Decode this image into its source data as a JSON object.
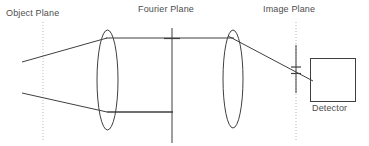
{
  "figure": {
    "width": 369,
    "height": 146,
    "background_color": "#ffffff",
    "ink_color": "#3f3f3f",
    "dotted_color": "#b4b4b4",
    "text_color": "#4d4d4d"
  },
  "labels": {
    "object_plane": "Object Plane",
    "fourier_plane": "Fourier Plane",
    "image_plane": "Image Plane",
    "detector": "Detector"
  },
  "elements": {
    "object_plane_line": {
      "name": "object-plane-dotted-line",
      "x": 43,
      "y_top": 22,
      "y_bottom": 141,
      "style": "dotted"
    },
    "fourier_plane_line": {
      "name": "fourier-plane-line",
      "x": 172,
      "y_top": 28,
      "y_bottom": 143,
      "style": "solid"
    },
    "image_plane_line": {
      "name": "image-plane-dotted-line",
      "x": 296,
      "y_top": 22,
      "y_bottom": 141,
      "style": "dotted"
    },
    "lens_1": {
      "name": "lens-one",
      "cx": 107.5,
      "cy": 80,
      "rx": 10.5,
      "ry": 50
    },
    "lens_2": {
      "name": "lens-two",
      "cx": 233,
      "cy": 79,
      "rx": 10,
      "ry": 49
    },
    "detector_box": {
      "name": "detector-box",
      "x": 310,
      "y": 58,
      "width": 45,
      "height": 43
    },
    "rays": {
      "upper_converging": {
        "x1": 22,
        "y1": 62,
        "x2": 107,
        "y2": 38
      },
      "lower_converging": {
        "x1": 22,
        "y1": 93,
        "x2": 107,
        "y2": 112
      },
      "upper_collimated": {
        "x1": 107,
        "y1": 38,
        "x2": 233,
        "y2": 38
      },
      "lower_collimated": {
        "x1": 108,
        "y1": 112,
        "x2": 172,
        "y2": 112
      },
      "output_ray": {
        "x1": 231,
        "y1": 37,
        "x2": 312,
        "y2": 80
      }
    },
    "fourier_tick": {
      "name": "fourier-plane-tick",
      "x_left": 164,
      "x_right": 180,
      "y": 38
    },
    "image_extent_marker": {
      "name": "image-height-marker",
      "x": 296,
      "y_top": 45,
      "y_bottom": 93,
      "tick_upper_y": 67,
      "tick_lower_y": 73,
      "tick_half_width": 5
    }
  }
}
